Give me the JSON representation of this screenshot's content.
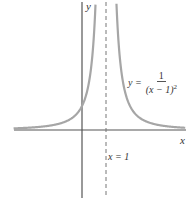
{
  "chart_data": {
    "type": "line",
    "title": "",
    "function": "y = 1/(x-1)^2",
    "xlabel": "x",
    "ylabel": "y",
    "asymptote": {
      "type": "vertical",
      "x": 1,
      "label": "x = 1",
      "style": "dashed"
    },
    "horizontal_asymptote": {
      "y": 0
    },
    "y_intercept": 1,
    "grid": false,
    "legend": null
  },
  "labels": {
    "x_axis": "x",
    "y_axis": "y",
    "asymptote": "x = 1",
    "equation_lhs": "y =",
    "equation_numerator": "1",
    "equation_denominator": "(x − 1)",
    "equation_exponent": "2"
  },
  "colors": {
    "curve": "#a6a6a6",
    "axes": "#555555",
    "asymptote": "#777777"
  }
}
